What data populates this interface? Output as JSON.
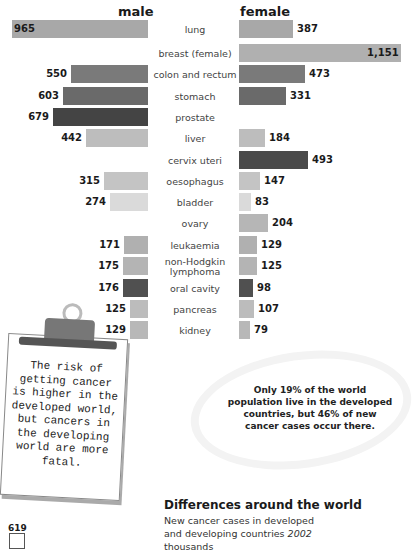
{
  "headers": {
    "male": "male",
    "female": "female"
  },
  "scale_px_per_unit": 0.1405,
  "chart_data": {
    "type": "bar",
    "title": "",
    "orientation": "horizontal-butterfly",
    "categories": [
      "lung",
      "breast (female)",
      "colon and rectum",
      "stomach",
      "prostate",
      "liver",
      "cervix uteri",
      "oesophagus",
      "bladder",
      "ovary",
      "leukaemia",
      "non-Hodgkin lymphoma",
      "oral cavity",
      "pancreas",
      "kidney"
    ],
    "series": [
      {
        "name": "male",
        "values": [
          965,
          null,
          550,
          603,
          679,
          442,
          null,
          315,
          274,
          null,
          171,
          175,
          176,
          125,
          129
        ]
      },
      {
        "name": "female",
        "values": [
          387,
          1151,
          473,
          331,
          null,
          184,
          493,
          147,
          83,
          204,
          129,
          125,
          98,
          107,
          79
        ]
      }
    ],
    "xlabel": "",
    "ylabel": "",
    "units": "thousands"
  },
  "rows": [
    {
      "label": "lung",
      "male": 965,
      "female": 387,
      "male_txt": "965",
      "female_txt": "387",
      "mcolor": "#a8a8a8",
      "fcolor": "#a8a8a8",
      "inside": true
    },
    {
      "label": "breast (female)",
      "male": null,
      "female": 1151,
      "male_txt": "",
      "female_txt": "1,151",
      "mcolor": "",
      "fcolor": "#b0b0b0",
      "finside": true
    },
    {
      "label": "colon and rectum",
      "male": 550,
      "female": 473,
      "male_txt": "550",
      "female_txt": "473",
      "mcolor": "#7a7a7a",
      "fcolor": "#7a7a7a"
    },
    {
      "label": "stomach",
      "male": 603,
      "female": 331,
      "male_txt": "603",
      "female_txt": "331",
      "mcolor": "#6a6a6a",
      "fcolor": "#6a6a6a"
    },
    {
      "label": "prostate",
      "male": 679,
      "female": null,
      "male_txt": "679",
      "female_txt": "",
      "mcolor": "#444444",
      "fcolor": ""
    },
    {
      "label": "liver",
      "male": 442,
      "female": 184,
      "male_txt": "442",
      "female_txt": "184",
      "mcolor": "#bdbdbd",
      "fcolor": "#bdbdbd"
    },
    {
      "label": "cervix uteri",
      "male": null,
      "female": 493,
      "male_txt": "",
      "female_txt": "493",
      "mcolor": "",
      "fcolor": "#4a4a4a"
    },
    {
      "label": "oesophagus",
      "male": 315,
      "female": 147,
      "male_txt": "315",
      "female_txt": "147",
      "mcolor": "#c4c4c4",
      "fcolor": "#c4c4c4"
    },
    {
      "label": "bladder",
      "male": 274,
      "female": 83,
      "male_txt": "274",
      "female_txt": "83",
      "mcolor": "#dadada",
      "fcolor": "#dadada"
    },
    {
      "label": "ovary",
      "male": null,
      "female": 204,
      "male_txt": "",
      "female_txt": "204",
      "mcolor": "",
      "fcolor": "#b6b6b6"
    },
    {
      "label": "leukaemia",
      "male": 171,
      "female": 129,
      "male_txt": "171",
      "female_txt": "129",
      "mcolor": "#b0b0b0",
      "fcolor": "#b0b0b0"
    },
    {
      "label": "non-Hodgkin lymphoma",
      "male": 175,
      "female": 125,
      "male_txt": "175",
      "female_txt": "125",
      "mcolor": "#b4b4b4",
      "fcolor": "#b4b4b4",
      "two": true
    },
    {
      "label": "oral cavity",
      "male": 176,
      "female": 98,
      "male_txt": "176",
      "female_txt": "98",
      "mcolor": "#505050",
      "fcolor": "#505050"
    },
    {
      "label": "pancreas",
      "male": 125,
      "female": 107,
      "male_txt": "125",
      "female_txt": "107",
      "mcolor": "#bcbcbc",
      "fcolor": "#bcbcbc"
    },
    {
      "label": "kidney",
      "male": 129,
      "female": 79,
      "male_txt": "129",
      "female_txt": "79",
      "mcolor": "#b8b8b8",
      "fcolor": "#b8b8b8"
    }
  ],
  "clipboard": {
    "text": "The risk of getting cancer is higher in the developed world, but cancers in the developing world are more fatal."
  },
  "note": {
    "text": "Only 19% of the world population live in the developed countries, but 46% of new cancer cases occur there."
  },
  "section": {
    "title": "Differences around the world",
    "subtitle_line1": "New cancer cases in developed",
    "subtitle_line2": "and developing countries",
    "subtitle_year": "2002",
    "subtitle_line3": "thousands"
  },
  "mini_chart": {
    "value": "619"
  }
}
